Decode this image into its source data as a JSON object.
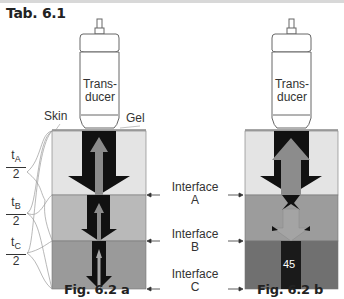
{
  "title": "Tab. 6.1",
  "labels": {
    "transducer_line1": "Trans-",
    "transducer_line2": "ducer",
    "skin": "Skin",
    "gel": "Gel",
    "interface_word": "Interface",
    "interface_a": "A",
    "interface_b": "B",
    "interface_c": "C",
    "value_45": "45"
  },
  "fractions": [
    {
      "num": "t",
      "sub": "A",
      "den": "2"
    },
    {
      "num": "t",
      "sub": "B",
      "den": "2"
    },
    {
      "num": "t",
      "sub": "C",
      "den": "2"
    }
  ],
  "captions": {
    "fig_a": "Fig. 6.2 a",
    "fig_b": "Fig. 6.2 b"
  },
  "colors": {
    "layer_a": "#e4e4e4",
    "layer_b_left": "#b9b9b9",
    "layer_c_left": "#9a9a9a",
    "layer_b_right": "#9c9c9c",
    "layer_c_right": "#707070",
    "beam_dark": "#111111",
    "echo_gray": "#8c8c8c"
  }
}
